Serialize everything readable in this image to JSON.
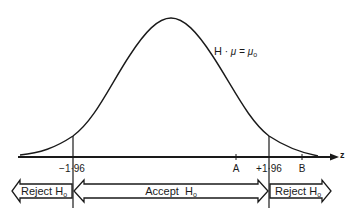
{
  "curve": {
    "label_main": "H",
    "label_sep": "·",
    "label_eq": "μ = μ",
    "label_sub": "o"
  },
  "axis": {
    "variable": "z",
    "ticks": [
      {
        "label": "−1·96",
        "z": -1.96
      },
      {
        "label": "A",
        "z": 1.3
      },
      {
        "label": "+1·96",
        "z": 1.96
      },
      {
        "label": "B",
        "z": 2.6
      }
    ]
  },
  "regions": [
    {
      "label": "Reject H",
      "sub": "o",
      "direction": "left"
    },
    {
      "label": "Accept  H",
      "sub": "o",
      "direction": "both"
    },
    {
      "label": "Reject H",
      "sub": "o",
      "direction": "right"
    }
  ],
  "colors": {
    "ink": "#1a1a1a",
    "background": "#ffffff"
  }
}
